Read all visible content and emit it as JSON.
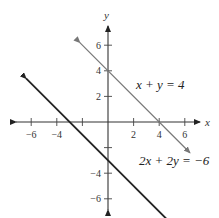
{
  "chart_data": {
    "type": "line",
    "title": "",
    "xlabel": "x",
    "ylabel": "y",
    "xlim": [
      -7.5,
      7.5
    ],
    "ylim": [
      -7.5,
      7.5
    ],
    "grid": false,
    "x_ticks": [
      -6,
      -4,
      -2,
      2,
      4,
      6
    ],
    "x_tick_labels": [
      "−6",
      "−4",
      "",
      "2",
      "4",
      "6"
    ],
    "y_ticks": [
      -6,
      -4,
      -2,
      2,
      4,
      6
    ],
    "y_tick_labels": [
      "−6",
      "−4",
      "",
      "2",
      "4",
      "6"
    ],
    "series": [
      {
        "name": "x + y = 4",
        "label": "x + y = 4",
        "color": "#777777",
        "x": [
          -2.2,
          6.4
        ],
        "y": [
          6.2,
          -2.4
        ]
      },
      {
        "name": "2x + 2y = −6",
        "label": "2x + 2y = −6",
        "color": "#222222",
        "x": [
          -6.4,
          5.1
        ],
        "y": [
          3.4,
          -8.1
        ]
      }
    ]
  }
}
